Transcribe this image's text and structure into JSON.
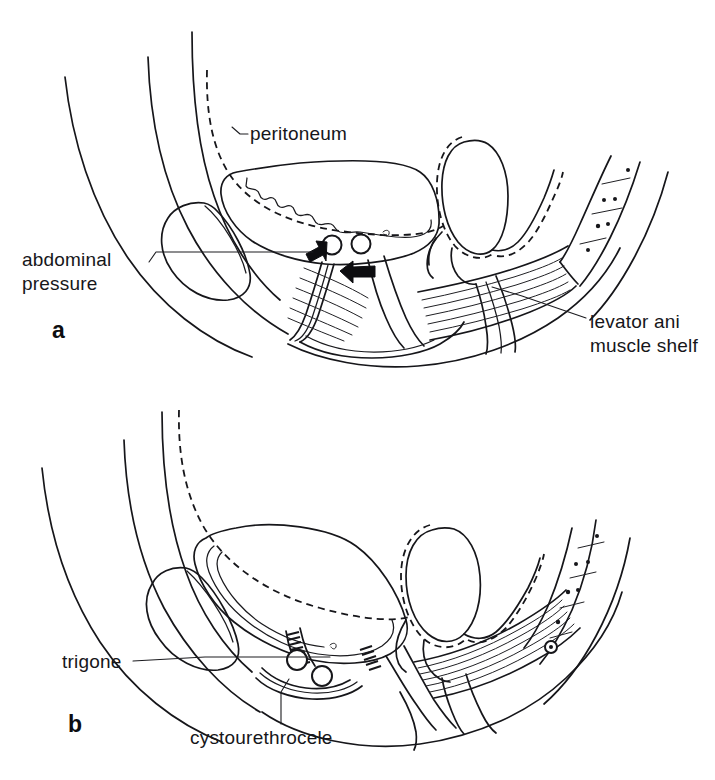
{
  "figure": {
    "background_color": "#ffffff",
    "ink_color": "#16161a",
    "width": 715,
    "height": 780
  },
  "panels": [
    {
      "id": "a",
      "letter": "a",
      "letter_x": 52,
      "letter_y": 338,
      "caption_role": "normal-pelvic-support",
      "labels": [
        {
          "name": "peritoneum",
          "text": "peritoneum",
          "x": 250,
          "y": 137,
          "anchor": "start",
          "leader": "M 232 128 L 240 134 L 247 134",
          "leader_style": "hook"
        },
        {
          "name": "abdominal-pressure",
          "text_lines": [
            "abdominal",
            "pressure"
          ],
          "x": 22,
          "y": 266,
          "anchor": "start",
          "leader": "M 150 260 L 156 252 L 314 252",
          "leader_style": "elbow-right"
        },
        {
          "name": "levator-ani-muscle-shelf",
          "text_lines": [
            "levator ani",
            "muscle shelf"
          ],
          "x": 590,
          "y": 328,
          "anchor": "start",
          "leader": "M 583 320 L 520 296 L 492 288",
          "leader_style": "straight"
        }
      ],
      "arrows": [
        {
          "name": "abdominal-pressure-arrow-upward",
          "direction": "up-right",
          "tip_x": 328,
          "tip_y": 243
        },
        {
          "name": "abdominal-pressure-arrow-leftward",
          "direction": "left",
          "tip_x": 340,
          "tip_y": 270
        }
      ],
      "structures": [
        "abdominal-wall-layer-outer",
        "abdominal-wall-layer-middle",
        "abdominal-wall-layer-inner",
        "peritoneum-dashed-line",
        "pubic-bone",
        "bladder",
        "bladder-mucosa-wavy",
        "urethra-cross-section",
        "vagina-cross-section",
        "uterus",
        "rectum",
        "levator-ani-muscle-striations",
        "sacrum-coccyx",
        "perineal-body"
      ]
    },
    {
      "id": "b",
      "letter": "b",
      "letter_x": 68,
      "letter_y": 730,
      "caption_role": "cystourethrocele-prolapse",
      "labels": [
        {
          "name": "trigone",
          "text": "trigone",
          "x": 62,
          "y": 668,
          "anchor": "start",
          "leader": "M 132 661 L 200 657 L 330 657",
          "leader_style": "straight"
        },
        {
          "name": "cystourethrocele",
          "text": "cystourethrocele",
          "x": 190,
          "y": 742,
          "anchor": "start",
          "leader": "M 281 724 L 281 690 L 288 678",
          "leader_style": "vertical"
        }
      ],
      "arrows": [],
      "structures": [
        "abdominal-wall-layer-outer",
        "abdominal-wall-layer-middle",
        "abdominal-wall-layer-inner",
        "peritoneum-dashed-line",
        "pubic-bone",
        "prolapsed-bladder",
        "trigone-hatched-band",
        "urethra-cross-section",
        "vagina-cross-section",
        "uterus",
        "rectum",
        "stretched-levator-ani",
        "sacrum-coccyx"
      ]
    }
  ],
  "sacrum_vertebral_marks": {
    "count": 4,
    "description": "small dots and short dashes marking sacral vertebral segments"
  }
}
